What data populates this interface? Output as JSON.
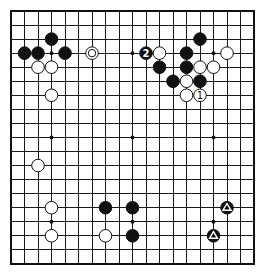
{
  "board": {
    "size": 19,
    "origin_x": 11,
    "origin_y": 11,
    "spacing_x": 13.5,
    "spacing_y": 14.05,
    "stone_radius": 6.3,
    "colors": {
      "line": "#1a1a1a",
      "black": "#111111",
      "white": "#ffffff",
      "background": "#ffffff"
    },
    "star_points": [
      [
        3,
        3
      ],
      [
        9,
        3
      ],
      [
        15,
        3
      ],
      [
        3,
        9
      ],
      [
        9,
        9
      ],
      [
        15,
        9
      ],
      [
        3,
        15
      ],
      [
        9,
        15
      ],
      [
        15,
        15
      ]
    ]
  },
  "stones": [
    {
      "color": "black",
      "col": 3,
      "row": 2
    },
    {
      "color": "black",
      "col": 1,
      "row": 3
    },
    {
      "color": "black",
      "col": 2,
      "row": 3
    },
    {
      "color": "black",
      "col": 4,
      "row": 3
    },
    {
      "color": "white",
      "col": 6,
      "row": 3,
      "mark": "circle"
    },
    {
      "color": "white",
      "col": 2,
      "row": 4
    },
    {
      "color": "white",
      "col": 3,
      "row": 4
    },
    {
      "color": "white",
      "col": 3,
      "row": 6
    },
    {
      "color": "black",
      "col": 10,
      "row": 3,
      "label": "2"
    },
    {
      "color": "white",
      "col": 11,
      "row": 3
    },
    {
      "color": "black",
      "col": 14,
      "row": 2
    },
    {
      "color": "black",
      "col": 13,
      "row": 3
    },
    {
      "color": "white",
      "col": 16,
      "row": 3
    },
    {
      "color": "black",
      "col": 11,
      "row": 4
    },
    {
      "color": "black",
      "col": 13,
      "row": 4
    },
    {
      "color": "white",
      "col": 14,
      "row": 4
    },
    {
      "color": "white",
      "col": 15,
      "row": 4
    },
    {
      "color": "black",
      "col": 12,
      "row": 5
    },
    {
      "color": "white",
      "col": 13,
      "row": 5
    },
    {
      "color": "black",
      "col": 14,
      "row": 5
    },
    {
      "color": "white",
      "col": 13,
      "row": 6
    },
    {
      "color": "white",
      "col": 14,
      "row": 6,
      "label": "1"
    },
    {
      "color": "white",
      "col": 2,
      "row": 11
    },
    {
      "color": "white",
      "col": 3,
      "row": 14
    },
    {
      "color": "white",
      "col": 3,
      "row": 16
    },
    {
      "color": "black",
      "col": 7,
      "row": 14
    },
    {
      "color": "white",
      "col": 7,
      "row": 16
    },
    {
      "color": "black",
      "col": 9,
      "row": 14
    },
    {
      "color": "black",
      "col": 9,
      "row": 16
    },
    {
      "color": "black",
      "col": 16,
      "row": 14,
      "mark": "triangle"
    },
    {
      "color": "black",
      "col": 15,
      "row": 16,
      "mark": "triangle"
    }
  ]
}
